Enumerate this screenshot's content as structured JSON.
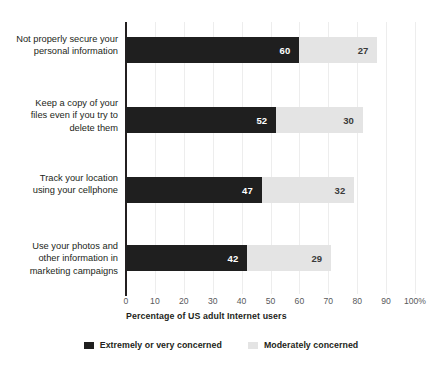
{
  "chart_data": {
    "type": "bar",
    "orientation": "horizontal",
    "stacked": true,
    "title": "",
    "xlabel": "Percentage of US adult Internet users",
    "ylabel": "",
    "xlim": [
      0,
      100
    ],
    "grid": true,
    "legend_position": "bottom",
    "xticks": [
      {
        "value": 0,
        "label": "0"
      },
      {
        "value": 10,
        "label": "10"
      },
      {
        "value": 20,
        "label": "20"
      },
      {
        "value": 30,
        "label": "30"
      },
      {
        "value": 40,
        "label": "40"
      },
      {
        "value": 50,
        "label": "50"
      },
      {
        "value": 60,
        "label": "60"
      },
      {
        "value": 70,
        "label": "70"
      },
      {
        "value": 80,
        "label": "80"
      },
      {
        "value": 90,
        "label": "90"
      },
      {
        "value": 100,
        "label": "100%"
      }
    ],
    "categories": [
      "Not properly secure your personal information",
      "Keep a copy of your files even if you try to delete them",
      "Track your location using your cellphone",
      "Use your photos and other information in marketing campaigns"
    ],
    "category_lines": [
      [
        "Not properly secure your",
        "personal information"
      ],
      [
        "Keep a copy of your",
        "files even if you try to",
        "delete them"
      ],
      [
        "Track your location",
        "using your cellphone"
      ],
      [
        "Use your photos and",
        "other information in",
        "marketing campaigns"
      ]
    ],
    "series": [
      {
        "name": "Extremely or very concerned",
        "color": "#1f1f1f",
        "values": [
          60,
          52,
          47,
          42
        ]
      },
      {
        "name": "Moderately concerned",
        "color": "#e4e4e4",
        "values": [
          27,
          30,
          32,
          29
        ]
      }
    ]
  },
  "legend": {
    "items": [
      {
        "label": "Extremely or very concerned",
        "swatch": "dark"
      },
      {
        "label": "Moderately concerned",
        "swatch": "light"
      }
    ]
  },
  "colors": {
    "dark_series": "#1f1f1f",
    "light_series": "#e4e4e4",
    "axis": "#231f20",
    "gridline": "#ededed",
    "background": "#ffffff"
  }
}
